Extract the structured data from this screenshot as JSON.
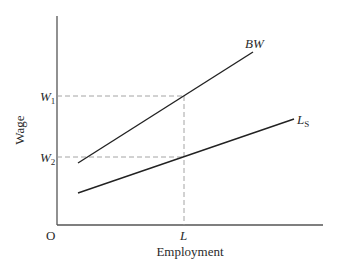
{
  "diagram": {
    "type": "economics-line-diagram",
    "axes": {
      "x_label": "Employment",
      "y_label": "Wage",
      "origin_label": "O"
    },
    "ticks": {
      "y": [
        {
          "label": "W",
          "subscript": "1",
          "level": "upper"
        },
        {
          "label": "W",
          "subscript": "2",
          "level": "lower"
        }
      ],
      "x": [
        {
          "label": "L"
        }
      ]
    },
    "curves": [
      {
        "id": "bw",
        "label": "BW",
        "subscript": ""
      },
      {
        "id": "ls",
        "label": "L",
        "subscript": "S"
      }
    ],
    "colors": {
      "line": "#222222",
      "axis": "#555555",
      "guide": "#9a9a9a",
      "text": "#2a2a2a"
    }
  }
}
